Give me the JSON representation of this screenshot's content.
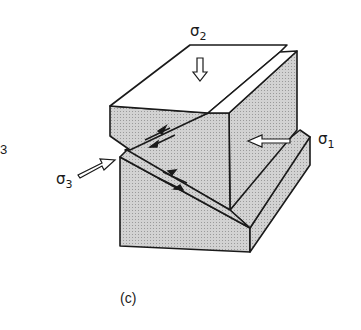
{
  "figure": {
    "caption": "(c)",
    "edge_label": "3",
    "stress_labels": {
      "sigma1": {
        "symbol": "σ",
        "subscript": "1"
      },
      "sigma2": {
        "symbol": "σ",
        "subscript": "2"
      },
      "sigma3": {
        "symbol": "σ",
        "subscript": "3"
      }
    },
    "colors": {
      "shade": "#c9c9c9",
      "line": "#1a1a1a",
      "face": "#ffffff"
    }
  }
}
